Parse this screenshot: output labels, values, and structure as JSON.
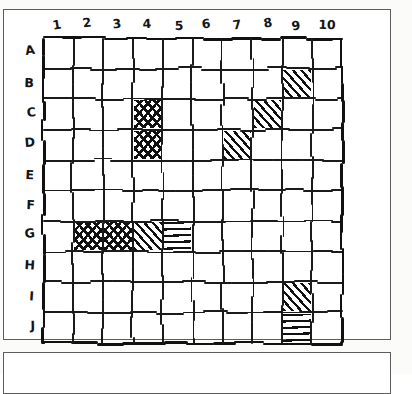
{
  "figure": {
    "kind": "hand-drawn-grid-worksheet"
  },
  "grid": {
    "columns": [
      "1",
      "2",
      "3",
      "4",
      "5",
      "6",
      "7",
      "8",
      "9",
      "10"
    ],
    "rows": [
      "A",
      "B",
      "C",
      "D",
      "E",
      "F",
      "G",
      "H",
      "I",
      "J"
    ],
    "column_count": 10,
    "row_count": 10,
    "line_color": "#1b1b1b",
    "fill_color": "#111111",
    "background": "#ffffff"
  },
  "shaded_cells": [
    {
      "row": "B",
      "col": "9",
      "pattern": "diagonal"
    },
    {
      "row": "C",
      "col": "4",
      "pattern": "cross"
    },
    {
      "row": "C",
      "col": "8",
      "pattern": "diagonal"
    },
    {
      "row": "D",
      "col": "4",
      "pattern": "cross"
    },
    {
      "row": "D",
      "col": "7",
      "pattern": "diagonal"
    },
    {
      "row": "G",
      "col": "2",
      "pattern": "cross"
    },
    {
      "row": "G",
      "col": "3",
      "pattern": "cross"
    },
    {
      "row": "G",
      "col": "4",
      "pattern": "diagonal"
    },
    {
      "row": "G",
      "col": "5",
      "pattern": "horizontal"
    },
    {
      "row": "I",
      "col": "9",
      "pattern": "diagonal"
    },
    {
      "row": "J",
      "col": "9",
      "pattern": "horizontal"
    }
  ],
  "shaded_cell_count": 11
}
